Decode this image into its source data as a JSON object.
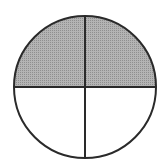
{
  "diagram": {
    "type": "fraction-circle",
    "total_parts": 4,
    "shaded_parts": 2,
    "shaded_fraction": "2/4",
    "center": [
      85,
      87
    ],
    "radius": 71,
    "colors": {
      "shade": "#a9a9a9",
      "stroke": "#2a2a2a",
      "background": "#ffffff"
    },
    "parts": [
      {
        "name": "top-left",
        "shaded": true
      },
      {
        "name": "top-right",
        "shaded": true
      },
      {
        "name": "bottom-left",
        "shaded": false
      },
      {
        "name": "bottom-right",
        "shaded": false
      }
    ]
  }
}
